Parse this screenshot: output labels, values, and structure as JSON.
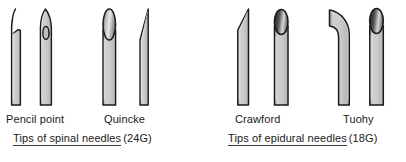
{
  "figure": {
    "background_color": "#ffffff",
    "width": 406,
    "height": 162
  },
  "colors": {
    "outline": "#1a1a1a",
    "metal_light": "#e8e8e8",
    "metal_mid": "#c0c0c0",
    "metal_dark": "#8a8a8a",
    "lumen_dark": "#2b2b2b",
    "text": "#1a1a1a",
    "underline": "#3a3a3a"
  },
  "panels": [
    {
      "id": "spinal",
      "caption_text": "Tips of spinal needles",
      "caption_gauge": "(24G)",
      "needles": [
        {
          "id": "pencil-point",
          "label": "Pencil point",
          "view": "side-with-side-port",
          "description": "Rounded conical pencil-point tip with lateral side port notch"
        },
        {
          "id": "pencil-point-front",
          "label": "",
          "view": "front-with-oval-port",
          "description": "Pencil-point tip seen from the front showing oval side hole"
        },
        {
          "id": "quincke-front",
          "label": "Quincke",
          "view": "front-bevel-ellipse",
          "description": "Cutting bevel seen face-on as a shaded ellipse"
        },
        {
          "id": "quincke-side",
          "label": "",
          "view": "side-sharp-bevel",
          "description": "Long sharp cutting bevel seen edge-on"
        }
      ]
    },
    {
      "id": "epidural",
      "caption_text": "Tips of epidural needles",
      "caption_gauge": "(18G)",
      "needles": [
        {
          "id": "crawford-side",
          "label": "Crawford",
          "view": "side-short-bevel",
          "description": "Short blunt bevel angled at the tip"
        },
        {
          "id": "crawford-front",
          "label": "",
          "view": "front-lumen-ellipse",
          "description": "Crawford tip seen face-on with dark elliptical lumen"
        },
        {
          "id": "tuohy-side",
          "label": "Tuohy",
          "view": "side-curved-huber",
          "description": "Curved Huber point deflecting the catheter laterally"
        },
        {
          "id": "tuohy-front",
          "label": "",
          "view": "front-lumen-ellipse",
          "description": "Tuohy tip seen face-on with dark elliptical lumen"
        }
      ]
    }
  ]
}
